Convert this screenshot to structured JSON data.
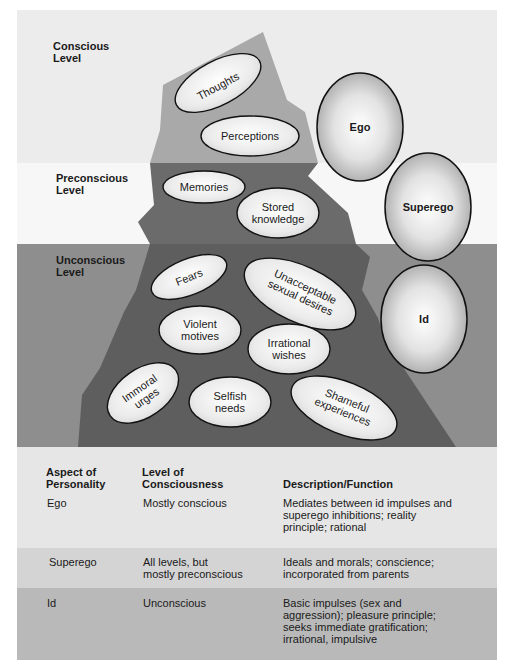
{
  "levels": [
    {
      "id": "conscious",
      "label": "Conscious\nLevel",
      "color": "#ececec"
    },
    {
      "id": "preconscious",
      "label": "Preconscious\nLevel",
      "color": "#f7f7f7"
    },
    {
      "id": "unconscious",
      "label": "Unconscious\nLevel",
      "color": "#8e8e8e"
    }
  ],
  "iceberg": {
    "conscious_color": "#a9a9a9",
    "preconscious_color": "#6b6b6b",
    "unconscious_color": "#5e5e5e",
    "contents": [
      {
        "label": "Thoughts",
        "level": "conscious"
      },
      {
        "label": "Perceptions",
        "level": "conscious"
      },
      {
        "label": "Memories",
        "level": "preconscious"
      },
      {
        "label": "Stored knowledge",
        "level": "preconscious"
      },
      {
        "label": "Fears",
        "level": "unconscious"
      },
      {
        "label": "Unacceptable sexual desires",
        "level": "unconscious"
      },
      {
        "label": "Violent motives",
        "level": "unconscious"
      },
      {
        "label": "Irrational wishes",
        "level": "unconscious"
      },
      {
        "label": "Immoral urges",
        "level": "unconscious"
      },
      {
        "label": "Selfish needs",
        "level": "unconscious"
      },
      {
        "label": "Shameful experiences",
        "level": "unconscious"
      }
    ]
  },
  "structures": [
    {
      "label": "Ego"
    },
    {
      "label": "Superego"
    },
    {
      "label": "Id"
    }
  ],
  "table": {
    "headers": [
      "Aspect of\nPersonality",
      "Level of\nConsciousness",
      "Description/Function"
    ],
    "rows": [
      {
        "aspect": "Ego",
        "level": "Mostly conscious",
        "description": "Mediates between id impulses and\nsuperego inhibitions; reality\nprinciple; rational",
        "bg": "#e6e6e6"
      },
      {
        "aspect": "Superego",
        "level": "All levels, but\nmostly preconscious",
        "description": "Ideals and morals; conscience;\nincorporated from parents",
        "bg": "#d4d4d4"
      },
      {
        "aspect": "Id",
        "level": "Unconscious",
        "description": "Basic impulses (sex and\naggression); pleasure principle;\nseeks immediate gratification;\nirrational, impulsive",
        "bg": "#b9b9b9"
      }
    ]
  }
}
